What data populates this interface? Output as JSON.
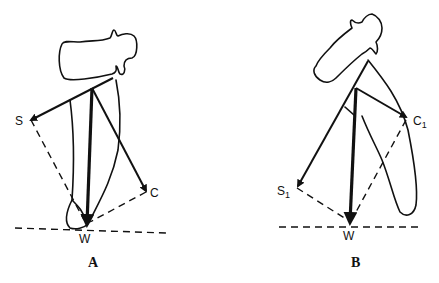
{
  "figure": {
    "panels": [
      {
        "id": "A",
        "label": "A",
        "vectors": [
          {
            "name": "S",
            "label": "S",
            "type": "component"
          },
          {
            "name": "C",
            "label": "C",
            "type": "component"
          },
          {
            "name": "W",
            "label": "W",
            "type": "resultant"
          }
        ]
      },
      {
        "id": "B",
        "label": "B",
        "vectors": [
          {
            "name": "S1",
            "label": "S",
            "subscript": "1",
            "type": "component"
          },
          {
            "name": "C1",
            "label": "C",
            "subscript": "1",
            "type": "component"
          },
          {
            "name": "W",
            "label": "W",
            "type": "resultant"
          }
        ]
      }
    ]
  }
}
